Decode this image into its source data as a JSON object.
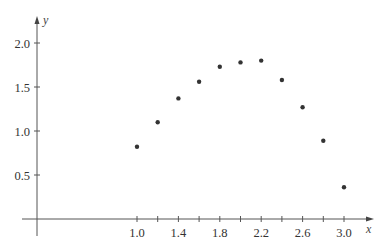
{
  "chart_data": {
    "type": "scatter",
    "title": "",
    "xlabel": "x",
    "ylabel": "y",
    "xlim": [
      0,
      3.1
    ],
    "ylim": [
      0,
      2.2
    ],
    "grid": false,
    "legend": null,
    "x_ticks": [
      1.0,
      1.2,
      1.4,
      1.6,
      1.8,
      2.0,
      2.2,
      2.4,
      2.6,
      2.8,
      3.0
    ],
    "x_tick_labels": [
      "1.0",
      "1.4",
      "1.8",
      "2.2",
      "2.6",
      "3.0"
    ],
    "y_ticks": [
      0.5,
      1.0,
      1.5,
      2.0
    ],
    "y_tick_labels": [
      "0.5",
      "1.0",
      "1.5",
      "2.0"
    ],
    "series": [
      {
        "name": "data",
        "x": [
          1.0,
          1.2,
          1.4,
          1.6,
          1.8,
          2.0,
          2.2,
          2.4,
          2.6,
          2.8,
          3.0
        ],
        "y": [
          0.82,
          1.1,
          1.37,
          1.56,
          1.73,
          1.78,
          1.8,
          1.58,
          1.27,
          0.89,
          0.36
        ]
      }
    ],
    "colors": {
      "point": "#333333",
      "axis": "#555555",
      "text": "#333333"
    }
  }
}
